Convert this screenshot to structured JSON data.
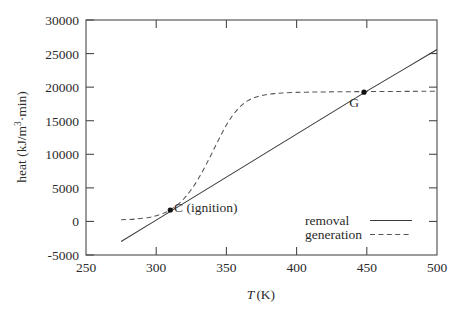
{
  "chart_data": {
    "type": "line",
    "title": "",
    "xlabel": "T (K)",
    "ylabel": "heat (kJ/m3·min)",
    "xlim": [
      250,
      500
    ],
    "ylim": [
      -5000,
      30000
    ],
    "xticks": [
      250,
      300,
      350,
      400,
      450,
      500
    ],
    "yticks": [
      -5000,
      0,
      5000,
      10000,
      15000,
      20000,
      25000,
      30000
    ],
    "xtick_labels": [
      "250",
      "300",
      "350",
      "400",
      "450",
      "500"
    ],
    "ytick_labels": [
      "-5000",
      "0",
      "5000",
      "10000",
      "15000",
      "20000",
      "25000",
      "30000"
    ],
    "grid": false,
    "legend_position": "lower-right-inside",
    "series": [
      {
        "name": "removal",
        "style": "solid",
        "color": "#3a3a3a",
        "x": [
          275,
          300,
          325,
          350,
          375,
          400,
          425,
          450,
          475,
          500
        ],
        "values": [
          -3000,
          200,
          3400,
          6600,
          9800,
          13000,
          16200,
          19400,
          22500,
          25600
        ]
      },
      {
        "name": "generation",
        "style": "dashed",
        "color": "#555555",
        "x": [
          275,
          285,
          295,
          300,
          305,
          310,
          315,
          320,
          325,
          330,
          335,
          340,
          345,
          350,
          355,
          360,
          365,
          370,
          375,
          380,
          385,
          390,
          400,
          410,
          420,
          430,
          440,
          450,
          460,
          470,
          480,
          490,
          500
        ],
        "values": [
          250,
          350,
          600,
          850,
          1200,
          1700,
          2450,
          3450,
          4750,
          6350,
          8250,
          10300,
          12400,
          14350,
          15950,
          17150,
          17950,
          18450,
          18750,
          18950,
          19050,
          19120,
          19220,
          19260,
          19290,
          19310,
          19330,
          19340,
          19350,
          19360,
          19370,
          19380,
          19390
        ]
      }
    ],
    "annotations": [
      {
        "id": "C",
        "label": "C (ignition)",
        "x": 310,
        "y": 1700,
        "marker": true
      },
      {
        "id": "G",
        "label": "G",
        "x": 448,
        "y": 19250,
        "marker": true
      }
    ]
  },
  "legend": {
    "items": [
      {
        "label": "removal",
        "style": "solid"
      },
      {
        "label": "generation",
        "style": "dashed"
      }
    ]
  },
  "axes": {
    "x_title_symbol": "T",
    "x_title_unit": "(K)",
    "y_title_pre": "heat (kJ/m",
    "y_title_sup": "3",
    "y_title_post": "·min)"
  }
}
